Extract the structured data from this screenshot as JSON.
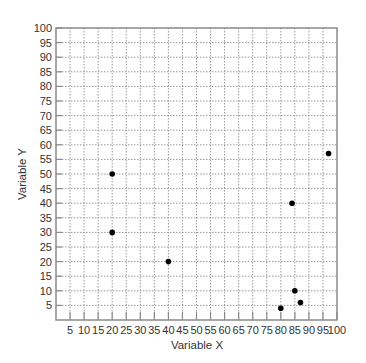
{
  "chart_data": {
    "type": "scatter",
    "title": "",
    "xlabel": "Variable X",
    "ylabel": "Variable Y",
    "xlim": [
      0,
      100
    ],
    "ylim": [
      0,
      100
    ],
    "grid": true,
    "legend": null,
    "x_ticks": [
      5,
      10,
      15,
      20,
      25,
      30,
      35,
      40,
      45,
      50,
      55,
      60,
      65,
      70,
      75,
      80,
      85,
      90,
      95,
      100
    ],
    "y_ticks": [
      5,
      10,
      15,
      20,
      25,
      30,
      35,
      40,
      45,
      50,
      55,
      60,
      65,
      70,
      75,
      80,
      85,
      90,
      95,
      100
    ],
    "points": [
      {
        "x": 20,
        "y": 50
      },
      {
        "x": 20,
        "y": 30
      },
      {
        "x": 40,
        "y": 20
      },
      {
        "x": 84,
        "y": 40
      },
      {
        "x": 97,
        "y": 57
      },
      {
        "x": 85,
        "y": 10
      },
      {
        "x": 87,
        "y": 6
      },
      {
        "x": 80,
        "y": 4
      }
    ]
  },
  "colors": {
    "point": "#000000",
    "grid": "#9a9a9a",
    "frame": "#8a8a8a",
    "text": "#333333"
  }
}
